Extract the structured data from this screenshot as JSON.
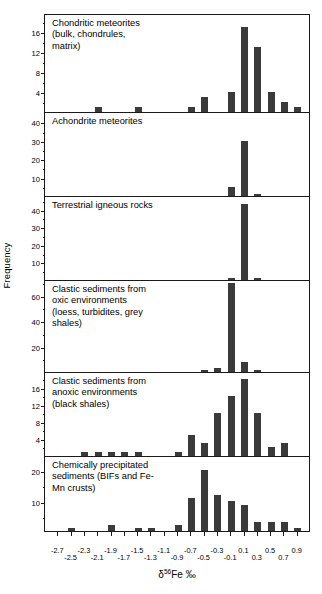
{
  "axes": {
    "ylabel": "Frequency",
    "xlabel_prefix": "δ",
    "xlabel_sup": "56",
    "xlabel_suffix": "Fe ‰",
    "xlabel_full": "δ56Fe ‰"
  },
  "chart_data": {
    "type": "bar",
    "title": "",
    "xlabel": "δ56Fe ‰",
    "ylabel": "Frequency",
    "xlim": [
      -2.8,
      1.0
    ],
    "bin_width": 0.2,
    "grid": false,
    "legend": "none",
    "x_tick_labels": [
      "-2.7",
      "-2.5",
      "-2.3",
      "-2.1",
      "-1.9",
      "-1.7",
      "-1.5",
      "-1.3",
      "-1.1",
      "-0.9",
      "-0.7",
      "-0.5",
      "-0.3",
      "-0.1",
      "0.1",
      "0.3",
      "0.5",
      "0.7",
      "0.9"
    ],
    "bin_centers": [
      -2.7,
      -2.5,
      -2.3,
      -2.1,
      -1.9,
      -1.7,
      -1.5,
      -1.3,
      -1.1,
      -0.9,
      -0.7,
      -0.5,
      -0.3,
      -0.1,
      0.1,
      0.3,
      0.5,
      0.7,
      0.9
    ],
    "panels": [
      {
        "id": "chondritic-meteorites",
        "caption": "Chondritic meteorites\n(bulk, chondrules,\nmatrix)",
        "ylim": [
          0,
          19
        ],
        "yticks": [
          4,
          8,
          12,
          16
        ],
        "yticks_minor": [
          2,
          6,
          10,
          14,
          18
        ],
        "values": [
          0,
          0,
          0,
          1,
          0,
          0,
          1,
          0,
          0,
          0,
          1,
          3,
          0,
          4,
          17,
          13,
          4,
          2,
          1
        ]
      },
      {
        "id": "achondrite-meteorites",
        "caption": "Achondrite meteorites",
        "ylim": [
          0,
          44
        ],
        "yticks": [
          10,
          20,
          30,
          40
        ],
        "yticks_minor": [
          5,
          15,
          25,
          35
        ],
        "values": [
          0,
          0,
          0,
          0,
          0,
          0,
          0,
          0,
          0,
          0,
          0,
          0,
          0,
          5,
          30,
          1,
          0,
          0,
          0
        ]
      },
      {
        "id": "terrestrial-igneous-rocks",
        "caption": "Terrestrial igneous rocks",
        "ylim": [
          0,
          46
        ],
        "yticks": [
          10,
          20,
          30,
          40
        ],
        "yticks_minor": [
          5,
          15,
          25,
          35,
          45
        ],
        "values": [
          0,
          0,
          0,
          0,
          0,
          0,
          0,
          0,
          0,
          0,
          0,
          0,
          0,
          1,
          43,
          1,
          0,
          0,
          0
        ]
      },
      {
        "id": "clastic-sediments-oxic",
        "caption": "Clastic sediments from\noxic environments\n(loess, turbidites, grey\nshales)",
        "ylim": [
          0,
          70
        ],
        "yticks": [
          20,
          40,
          60
        ],
        "yticks_minor": [
          10,
          30,
          50,
          70
        ],
        "values": [
          0,
          0,
          0,
          0,
          0,
          0,
          0,
          0,
          0,
          0,
          0,
          1,
          3,
          70,
          8,
          1,
          0,
          0,
          0
        ]
      },
      {
        "id": "clastic-sediments-anoxic",
        "caption": "Clastic sediments from\nanoxic environments\n(black shales)",
        "ylim": [
          0,
          19
        ],
        "yticks": [
          4,
          8,
          12,
          16
        ],
        "yticks_minor": [
          2,
          6,
          10,
          14,
          18
        ],
        "values": [
          0,
          0,
          1,
          1,
          1,
          1,
          1,
          0,
          0,
          1,
          5,
          3,
          10,
          14,
          18,
          10,
          2,
          3,
          0
        ]
      },
      {
        "id": "chemically-precipitated-sediments",
        "caption": "Chemically precipitated\nsediments (BIFs and Fe-\nMn crusts)",
        "ylim": [
          0,
          24
        ],
        "yticks": [
          10,
          20
        ],
        "yticks_minor": [
          5,
          15
        ],
        "values": [
          0,
          1,
          0,
          0,
          2,
          0,
          1,
          1,
          0,
          2,
          11,
          20,
          12,
          10,
          8.5,
          3,
          3,
          3,
          1
        ]
      }
    ]
  }
}
